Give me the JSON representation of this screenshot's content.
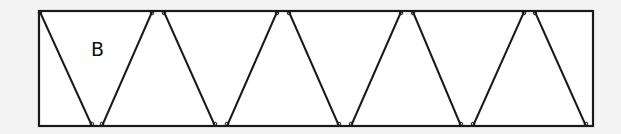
{
  "diagram": {
    "type": "triangle-strip",
    "label": "B",
    "label_position": {
      "x": 91,
      "y": 40
    },
    "colors": {
      "background": "#f3f3f3",
      "fill": "#ffffff",
      "stroke": "#1a1a1a"
    },
    "rectangle": {
      "x1": 39,
      "y1": 11,
      "x2": 593,
      "y2": 126
    },
    "top_vertices_x": [
      39,
      152,
      164,
      277,
      289,
      401,
      413,
      524,
      535
    ],
    "bottom_vertices_x": [
      92,
      102,
      215,
      227,
      339,
      351,
      461,
      473,
      586
    ],
    "segments": [
      {
        "from": [
          40,
          12
        ],
        "to": [
          92,
          126
        ]
      },
      {
        "from": [
          102,
          126
        ],
        "to": [
          152,
          12
        ]
      },
      {
        "from": [
          164,
          12
        ],
        "to": [
          215,
          126
        ]
      },
      {
        "from": [
          227,
          126
        ],
        "to": [
          277,
          12
        ]
      },
      {
        "from": [
          289,
          12
        ],
        "to": [
          339,
          126
        ]
      },
      {
        "from": [
          351,
          126
        ],
        "to": [
          401,
          12
        ]
      },
      {
        "from": [
          413,
          12
        ],
        "to": [
          461,
          126
        ]
      },
      {
        "from": [
          473,
          126
        ],
        "to": [
          524,
          12
        ]
      },
      {
        "from": [
          535,
          12
        ],
        "to": [
          586,
          126
        ]
      }
    ]
  }
}
